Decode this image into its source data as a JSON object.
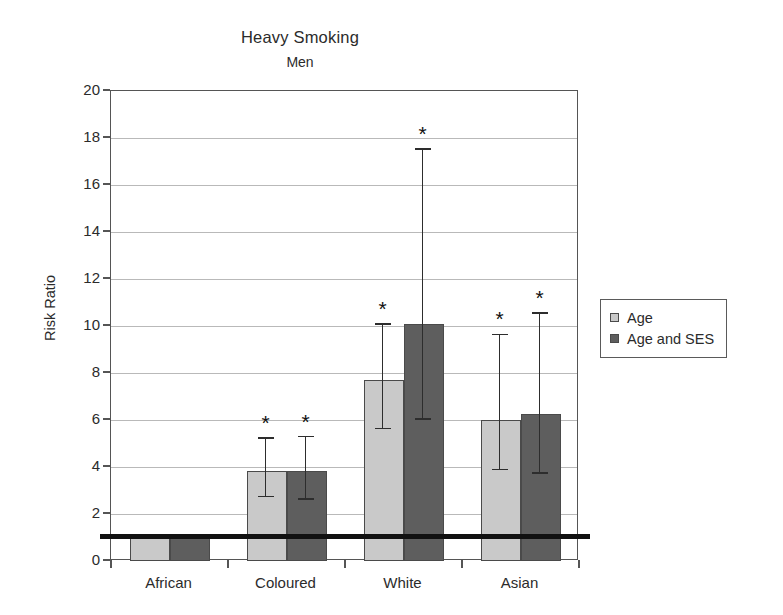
{
  "chart_data": {
    "type": "bar",
    "title": "Heavy Smoking",
    "subtitle": "Men",
    "xlabel": "",
    "ylabel": "Risk Ratio",
    "ylim": [
      0,
      20
    ],
    "ytick_step": 2,
    "yticks": [
      "20",
      "18",
      "16",
      "14",
      "12",
      "10",
      "8",
      "6",
      "4",
      "2",
      "0"
    ],
    "grid": true,
    "legend_position": "right",
    "reference_line": 1.0,
    "significance_marker": "*",
    "categories": [
      "African",
      "Coloured",
      "White",
      "Asian"
    ],
    "series": [
      {
        "name": "Age",
        "color": "#c9c9c9",
        "values": [
          1.0,
          3.85,
          7.7,
          6.0
        ],
        "ci_low": [
          null,
          2.7,
          5.6,
          3.85
        ],
        "ci_high": [
          null,
          5.2,
          10.05,
          9.6
        ],
        "significant": [
          false,
          true,
          true,
          true
        ]
      },
      {
        "name": "Age and SES",
        "color": "#5e5e5e",
        "values": [
          1.0,
          3.85,
          10.1,
          6.25
        ],
        "ci_low": [
          null,
          2.6,
          6.0,
          3.7
        ],
        "ci_high": [
          null,
          5.25,
          17.5,
          10.5
        ],
        "significant": [
          false,
          true,
          true,
          true
        ]
      }
    ]
  },
  "legend": {
    "entries": [
      {
        "label": "Age",
        "color": "#c9c9c9"
      },
      {
        "label": "Age and SES",
        "color": "#5e5e5e"
      }
    ]
  }
}
